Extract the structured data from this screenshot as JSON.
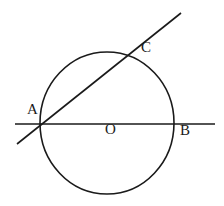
{
  "figure": {
    "name": "circle-with-secant-and-diameter",
    "background_color": "#ffffff",
    "stroke_color": "#1a1a1a",
    "stroke_width": 1.6,
    "canvas": {
      "width": 224,
      "height": 206
    }
  },
  "circle": {
    "name": "circle-o",
    "center_x": 107,
    "center_y": 123,
    "radius_x": 67,
    "radius_y": 71
  },
  "lines": [
    {
      "name": "horizontal-line-ab",
      "x1": 15,
      "y1": 124,
      "x2": 215,
      "y2": 124
    },
    {
      "name": "diagonal-secant-line-ac",
      "x1": 17,
      "y1": 144,
      "x2": 181,
      "y2": 13
    }
  ],
  "labels": {
    "a": "A",
    "c": "C",
    "o": "O",
    "b": "B"
  }
}
